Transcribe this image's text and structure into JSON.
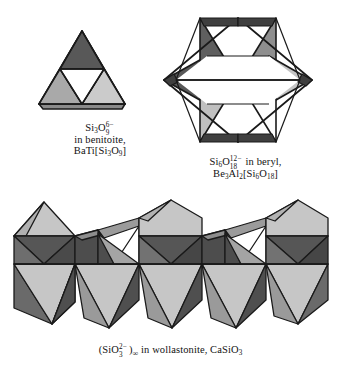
{
  "figure": {
    "kind": "crystal-structure-diagram",
    "background_color": "#ffffff",
    "palette": {
      "face_light": "#cbcbcb",
      "face_medium": "#a9a9a9",
      "face_dark": "#585858",
      "face_darker": "#4a4a4a",
      "face_white": "#ffffff",
      "edge": "#1a1a1a",
      "text": "#111111"
    }
  },
  "panels": [
    {
      "id": "benitoite",
      "name": "cyclic-trisilicate",
      "structure": "three corner-sharing SiO4 tetrahedra forming a 3-ring",
      "tetrahedra_count": 3,
      "caption_lines": [
        "Si3O9 6-",
        "in benitoite,",
        "BaTi[Si3O9]"
      ],
      "formula_ion": "Si3O9^6-",
      "mineral": "benitoite",
      "mineral_formula": "BaTi[Si3O9]"
    },
    {
      "id": "beryl",
      "name": "cyclic-hexasilicate",
      "structure": "six corner-sharing SiO4 tetrahedra forming a 6-ring star",
      "tetrahedra_count": 6,
      "caption_lines": [
        "Si6O18 12- in beryl,",
        "Be3Al2[Si6O18]"
      ],
      "formula_ion": "Si6O18^12-",
      "mineral": "beryl",
      "mineral_formula": "Be3Al2[Si6O18]"
    },
    {
      "id": "wollastonite",
      "name": "infinite-chain-silicate",
      "structure": "infinite single chain of corner-sharing SiO4 tetrahedra",
      "repeat_period": 3,
      "caption_lines": [
        "(SiO3 2-)inf in wollastonite, CaSiO3"
      ],
      "formula_ion": "(SiO3^2-)∞",
      "mineral": "wollastonite",
      "mineral_formula": "CaSiO3"
    }
  ],
  "text": {
    "benitoite": {
      "l1_a": "Si",
      "l1_b": "3",
      "l1_c": "O",
      "l1_sup": "6−",
      "l1_sub": "9",
      "l2": "in benitoite,",
      "l3_a": "BaTi[Si",
      "l3_b": "3",
      "l3_c": "O",
      "l3_d": "9",
      "l3_e": "]"
    },
    "beryl": {
      "l1_a": "Si",
      "l1_b": "6",
      "l1_c": "O",
      "l1_sup": "12−",
      "l1_sub": "18",
      "l1_d": " in beryl,",
      "l2_a": "Be",
      "l2_b": "3",
      "l2_c": "Al",
      "l2_d": "2",
      "l2_e": "[Si",
      "l2_f": "6",
      "l2_g": "O",
      "l2_h": "18",
      "l2_i": "]"
    },
    "wollastonite": {
      "l1_a": "(SiO",
      "l1_sup": "2−",
      "l1_sub": "3",
      "l1_b": ")",
      "l1_inf": "∞",
      "l1_c": " in wollastonite, CaSiO",
      "l1_d": "3"
    }
  }
}
